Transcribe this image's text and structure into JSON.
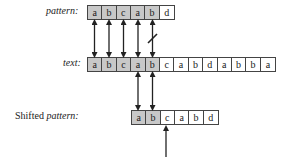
{
  "labels": {
    "pattern": "pattern:",
    "text": "text:",
    "shifted_prefix": "Shifted ",
    "shifted_italic": "pattern:"
  },
  "pattern": [
    "a",
    "b",
    "c",
    "a",
    "b",
    "d"
  ],
  "text": [
    "a",
    "b",
    "c",
    "a",
    "b",
    "c",
    "a",
    "b",
    "d",
    "a",
    "b",
    "b",
    "a"
  ],
  "shifted_pattern": [
    "a",
    "b",
    "c",
    "a",
    "b",
    "d"
  ],
  "shading": {
    "pattern": [
      true,
      true,
      true,
      true,
      true,
      false
    ],
    "text": [
      true,
      true,
      true,
      true,
      true,
      false,
      false,
      false,
      false,
      false,
      false,
      false,
      false
    ],
    "shifted_pattern": [
      true,
      true,
      false,
      false,
      false,
      false
    ]
  },
  "colors": {
    "shade": "#c8c8c8",
    "line": "#222222"
  }
}
